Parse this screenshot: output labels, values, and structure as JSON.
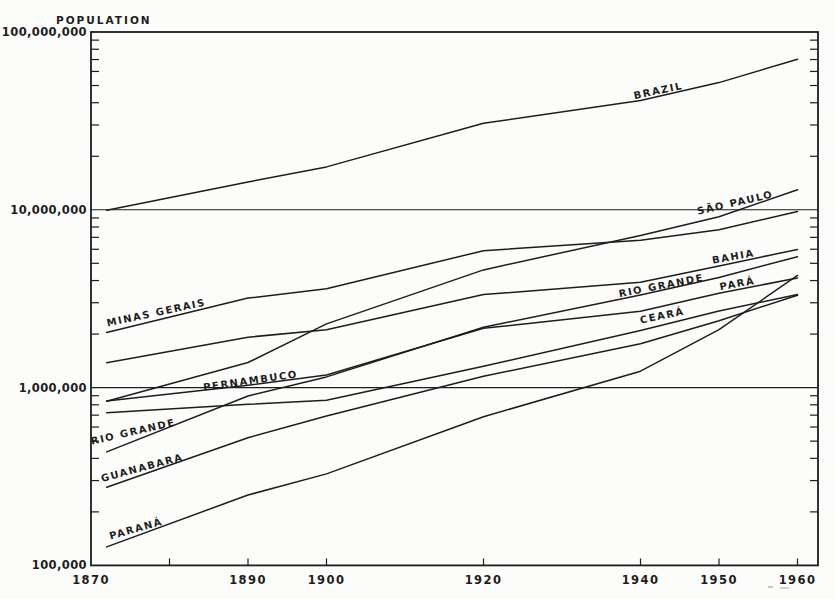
{
  "page": {
    "background": "#fcfcfa",
    "ink": "#1d1d1d"
  },
  "chart_data": {
    "type": "line",
    "y_axis": {
      "label": "POPULATION",
      "scale": "log",
      "ylim": [
        100000,
        100000000
      ],
      "ticks": [
        {
          "value": 100000000,
          "label": "100,000,000"
        },
        {
          "value": 10000000,
          "label": "10,000,000"
        },
        {
          "value": 1000000,
          "label": "1,000,000"
        },
        {
          "value": 100000,
          "label": "100,000"
        }
      ],
      "gridline_values": [
        10000000,
        1000000
      ],
      "minor_tick_multiples": [
        2,
        3,
        4,
        5,
        6,
        7,
        8,
        9
      ],
      "minor_tick_exponents": [
        5,
        6,
        7
      ]
    },
    "x_axis": {
      "xlim": [
        1870,
        1962.6
      ],
      "label_years": [
        1870,
        1890,
        1900,
        1920,
        1940,
        1950,
        1960
      ],
      "labels": [
        "1870",
        "1890",
        "1900",
        "1920",
        "1940",
        "1950",
        "1960"
      ],
      "tick_years": [
        1880,
        1890,
        1900,
        1920,
        1940,
        1950,
        1960
      ],
      "grid": false
    },
    "x": [
      1872,
      1890,
      1900,
      1920,
      1940,
      1950,
      1960
    ],
    "series": [
      {
        "id": "brazil",
        "name": "BRAZIL",
        "values": [
          9930000,
          14334000,
          17438000,
          30636000,
          41236000,
          51944000,
          70191000
        ]
      },
      {
        "id": "sao-paulo",
        "name": "SÃO PAULO",
        "values": [
          837000,
          1385000,
          2283000,
          4592000,
          7180000,
          9134000,
          12975000
        ]
      },
      {
        "id": "minas-gerais",
        "name": "MINAS GERAIS",
        "values": [
          2040000,
          3185000,
          3594000,
          5888000,
          6736000,
          7718000,
          9799000
        ]
      },
      {
        "id": "bahia",
        "name": "BAHIA",
        "values": [
          1380000,
          1920000,
          2118000,
          3334000,
          3918000,
          4835000,
          5991000
        ]
      },
      {
        "id": "rio-grande",
        "name": "RIO GRANDE",
        "values": [
          435000,
          897000,
          1149000,
          2183000,
          3321000,
          4165000,
          5449000
        ]
      },
      {
        "id": "pernambuco",
        "name": "PERNAMBUCO",
        "values": [
          842000,
          1030000,
          1178000,
          2155000,
          2688000,
          3395000,
          4137000
        ]
      },
      {
        "id": "ceara",
        "name": "CEARÁ",
        "values": [
          722000,
          806000,
          849000,
          1319000,
          2091000,
          2695000,
          3338000
        ]
      },
      {
        "id": "guanabara",
        "name": "GUANABARA",
        "values": [
          275000,
          523000,
          692000,
          1158000,
          1764000,
          2377000,
          3307000
        ]
      },
      {
        "id": "parana",
        "name": "PARANÁ",
        "values": [
          127000,
          249000,
          327000,
          686000,
          1236000,
          2116000,
          4278000
        ]
      }
    ],
    "line_labels": [
      {
        "id": "brazil",
        "text": "BRAZIL",
        "x": 659,
        "y": 94,
        "rotation": -12
      },
      {
        "id": "sao-paulo",
        "text": "SÃO PAULO",
        "x": 736,
        "y": 206,
        "rotation": -13
      },
      {
        "id": "bahia",
        "text": "BAHIA",
        "x": 734,
        "y": 260,
        "rotation": -10
      },
      {
        "id": "rio-grande-right",
        "text": "RIO GRANDE",
        "x": 662,
        "y": 289,
        "rotation": -11
      },
      {
        "id": "para",
        "text": "PARÁ",
        "x": 738,
        "y": 287,
        "rotation": -10
      },
      {
        "id": "minas-gerais",
        "text": "MINAS GERAIS",
        "x": 157,
        "y": 316,
        "rotation": -12
      },
      {
        "id": "ceara",
        "text": "CEARÁ",
        "x": 663,
        "y": 319,
        "rotation": -12
      },
      {
        "id": "pernambuco",
        "text": "PERNAMBUCO",
        "x": 251,
        "y": 384,
        "rotation": -8
      },
      {
        "id": "rio-grande-left",
        "text": "RIO GRANDE",
        "x": 134,
        "y": 435,
        "rotation": -13
      },
      {
        "id": "guanabara",
        "text": "GUANABARA",
        "x": 143,
        "y": 471,
        "rotation": -15
      },
      {
        "id": "parana",
        "text": "PARANÁ",
        "x": 137,
        "y": 532,
        "rotation": -16
      }
    ]
  }
}
